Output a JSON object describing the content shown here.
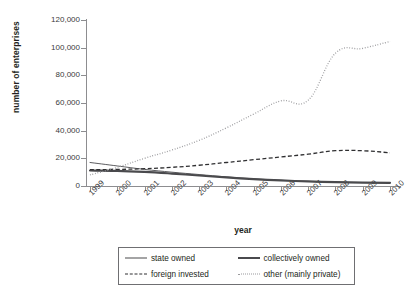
{
  "top_caption": "",
  "axes": {
    "y_title": "number of enterprises",
    "x_title": "year",
    "y_ticks": [
      "120,000",
      "100,000",
      "80,000",
      "60,000",
      "40,000",
      "20,000",
      "0"
    ],
    "x_ticks": [
      "1999",
      "2000",
      "2001",
      "2002",
      "2003",
      "2004",
      "2005",
      "2006",
      "2007",
      "2008",
      "2009",
      "2010"
    ]
  },
  "legend": {
    "items": [
      {
        "label": "state owned",
        "style": "solid-thin",
        "color": "#4a4a4d"
      },
      {
        "label": "collectively owned",
        "style": "solid-thick",
        "color": "#4a4a4d"
      },
      {
        "label": "foreign invested",
        "style": "dash",
        "color": "#2f2f31"
      },
      {
        "label": "other (mainly private)",
        "style": "dot",
        "color": "#9a9a9d"
      }
    ]
  },
  "chart_data": {
    "type": "line",
    "title": "",
    "xlabel": "year",
    "ylabel": "number of enterprises",
    "x": [
      1999,
      2000,
      2001,
      2002,
      2003,
      2004,
      2005,
      2006,
      2007,
      2008,
      2009,
      2010
    ],
    "categories": [
      "1999",
      "2000",
      "2001",
      "2002",
      "2003",
      "2004",
      "2005",
      "2006",
      "2007",
      "2008",
      "2009",
      "2010"
    ],
    "ylim": [
      0,
      120000
    ],
    "ytick_values": [
      0,
      20000,
      40000,
      60000,
      80000,
      100000,
      120000
    ],
    "grid": false,
    "legend_position": "bottom",
    "series": [
      {
        "name": "state owned",
        "style": "solid-thin",
        "color": "#4a4a4d",
        "values": [
          17000,
          14500,
          12000,
          10000,
          8300,
          6600,
          5200,
          4100,
          3300,
          2800,
          2500,
          2300
        ]
      },
      {
        "name": "collectively owned",
        "style": "solid-thick",
        "color": "#4a4a4d",
        "values": [
          11200,
          11000,
          10200,
          9000,
          7600,
          6200,
          5000,
          4000,
          3300,
          2800,
          2500,
          2300
        ]
      },
      {
        "name": "foreign invested",
        "style": "dash",
        "color": "#2f2f31",
        "values": [
          11800,
          12000,
          12500,
          13500,
          15000,
          17000,
          19000,
          21000,
          23000,
          25500,
          25500,
          24000
        ]
      },
      {
        "name": "other (mainly private)",
        "style": "dot",
        "color": "#9a9a9d",
        "values": [
          8000,
          13500,
          20000,
          26000,
          33000,
          42000,
          52000,
          61500,
          62000,
          96000,
          99500,
          104500
        ]
      }
    ]
  }
}
